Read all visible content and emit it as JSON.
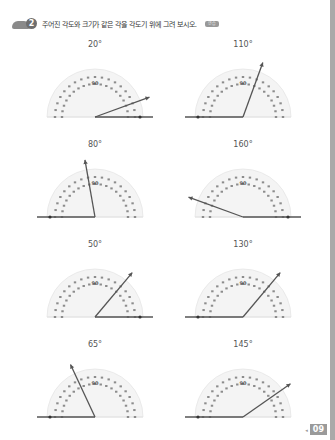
{
  "header": {
    "problem_number": "2",
    "instruction": "주어진 각도와 크기가 같은 각을 각도기 위에 그려 보시오.",
    "tag": "연습"
  },
  "protractor": {
    "center_label": "90",
    "colors": {
      "scale": "#8c8c8c",
      "ray": "#555555",
      "arc_bg": "#f4f4f4"
    }
  },
  "problems": [
    {
      "label": "20°",
      "angle": 20,
      "base": "right",
      "col": 0,
      "row": 0
    },
    {
      "label": "110°",
      "angle": 110,
      "base": "left",
      "col": 1,
      "row": 0
    },
    {
      "label": "80°",
      "angle": 80,
      "base": "left",
      "col": 0,
      "row": 1
    },
    {
      "label": "160°",
      "angle": 160,
      "base": "right",
      "col": 1,
      "row": 1
    },
    {
      "label": "50°",
      "angle": 50,
      "base": "right",
      "col": 0,
      "row": 2
    },
    {
      "label": "130°",
      "angle": 130,
      "base": "left",
      "col": 1,
      "row": 2
    },
    {
      "label": "65°",
      "angle": 65,
      "base": "left",
      "col": 0,
      "row": 3
    },
    {
      "label": "145°",
      "angle": 145,
      "base": "left",
      "col": 1,
      "row": 3
    }
  ],
  "footer": {
    "page_number": "09"
  }
}
